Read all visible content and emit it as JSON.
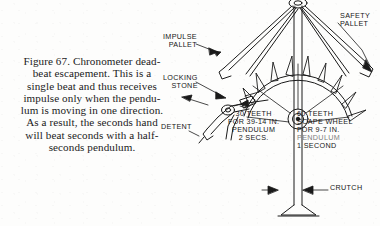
{
  "figure": {
    "caption_lines": [
      "Figure 67.  Chronometer dead-",
      "beat escapement.   This  is  a",
      "single beat and thus receives",
      "impulse only when the pendu-",
      "lum is moving in one direction.",
      "As a result, the seconds hand",
      "will beat seconds with a half-",
      "seconds pendulum."
    ],
    "caption_full": "Figure 67. Chronometer dead-beat escapement. This is a single beat and thus receives impulse only when the pendulum is moving in one direction. As a result, the seconds hand will beat seconds with a half-seconds pendulum."
  },
  "callouts": {
    "impulse_pallet": {
      "lines": [
        "IMPULSE",
        "PALLET"
      ]
    },
    "locking_stone": {
      "lines": [
        "LOCKING",
        "STONE"
      ]
    },
    "detent": {
      "lines": [
        "DETENT"
      ]
    },
    "safety_pallet": {
      "lines": [
        "SAFETY",
        "PALLET"
      ]
    },
    "crutch": {
      "lines": [
        "CRUTCH"
      ]
    },
    "left_wheel": {
      "lines": [
        "30 TEETH",
        "FOR 39-14 IN.",
        "PENDULUM",
        "2 SECS."
      ]
    },
    "right_wheel": {
      "lines": [
        "60 TEETH",
        "SCAPE WHEEL",
        "FOR  9-7 IN.",
        "PENDULUM",
        "1 SECOND"
      ]
    }
  },
  "style": {
    "ink": "#1a1a1a",
    "paper": "#fdfdfc",
    "faded_ink": "#7e7e7e"
  }
}
